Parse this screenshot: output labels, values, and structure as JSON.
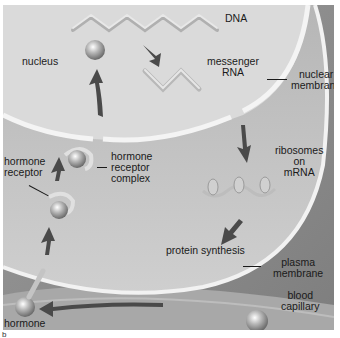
{
  "diagram": {
    "labels": {
      "dna": "DNA",
      "nucleus": "nucleus",
      "messenger_rna_line1": "messenger",
      "messenger_rna_line2": "RNA",
      "nuclear_membrane_line1": "nuclear",
      "nuclear_membrane_line2": "membrane",
      "hormone_receptor_line1": "hormone",
      "hormone_receptor_line2": "receptor",
      "hormone_receptor_complex_line1": "hormone",
      "hormone_receptor_complex_line2": "receptor",
      "hormone_receptor_complex_line3": "complex",
      "ribosomes_line1": "ribosomes",
      "ribosomes_line2": "on",
      "ribosomes_line3": "mRNA",
      "protein_synthesis": "protein synthesis",
      "plasma_membrane_line1": "plasma",
      "plasma_membrane_line2": "membrane",
      "blood_capillary_line1": "blood",
      "blood_capillary_line2": "capillary",
      "hormone": "hormone",
      "panel_marker": "b"
    },
    "colors": {
      "background_dark": "#8f8f8f",
      "cytoplasm": "#c4c4c4",
      "nucleus": "#d9d9d9",
      "membrane": "#f2f2f2",
      "arrow": "#4a4a4a",
      "text": "#1a1a1a"
    }
  }
}
